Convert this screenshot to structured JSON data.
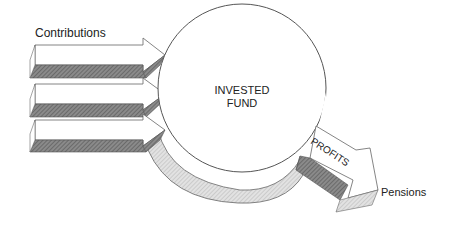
{
  "diagram": {
    "labels": {
      "contributions": "Contributions",
      "invested_fund_line1": "INVESTED",
      "invested_fund_line2": "FUND",
      "profits": "PROFITS",
      "pensions": "Pensions"
    },
    "inflow_arrow_count": 3,
    "colors": {
      "stroke": "#555555",
      "dark_hatch": "#777777",
      "light_hatch": "#cfcfcf",
      "text": "#222222"
    }
  }
}
